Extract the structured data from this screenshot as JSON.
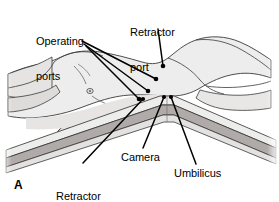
{
  "figure": {
    "panel_letter": "A",
    "title_alt": "Patient positioning and laparoscopic port placement, lateral view",
    "background_color": "#ffffff",
    "body_fill_color": "#ededed",
    "body_shade_color": "#e0dedd",
    "table_stripe_color": "#b0aaa8",
    "outline_color": "#3a3a3a",
    "leader_color": "#000000",
    "text_color": "#000000"
  },
  "annotations": [
    {
      "id": "operating-ports",
      "label": "Operating\nports",
      "label_line_1": "Operating",
      "label_line_2": "ports",
      "leader_count": 3,
      "marker": "filled-dot"
    },
    {
      "id": "retractor-port-top",
      "label": "Retractor\nport",
      "label_line_1": "Retractor",
      "label_line_2": "port",
      "leader_count": 1,
      "marker": "filled-dot"
    },
    {
      "id": "camera",
      "label": "Camera",
      "label_line_1": "Camera",
      "label_line_2": "",
      "leader_count": 1,
      "marker": "filled-dot"
    },
    {
      "id": "umbilicus",
      "label": "Umbilicus",
      "label_line_1": "Umbilicus",
      "label_line_2": "",
      "leader_count": 1,
      "marker": "filled-dot"
    },
    {
      "id": "retractor-port-bottom",
      "label": "Retractor\nport",
      "label_line_1": "Retractor",
      "label_line_2": "port",
      "leader_count": 1,
      "marker": "filled-dot"
    }
  ],
  "labels": {
    "operating_ports_line1": "Operating",
    "operating_ports_line2": "ports",
    "retractor_port_top_line1": "Retractor",
    "retractor_port_top_line2": "port",
    "camera": "Camera",
    "umbilicus": "Umbilicus",
    "retractor_port_bottom_line1": "Retractor",
    "retractor_port_bottom_line2": "port",
    "panel_letter": "A"
  }
}
